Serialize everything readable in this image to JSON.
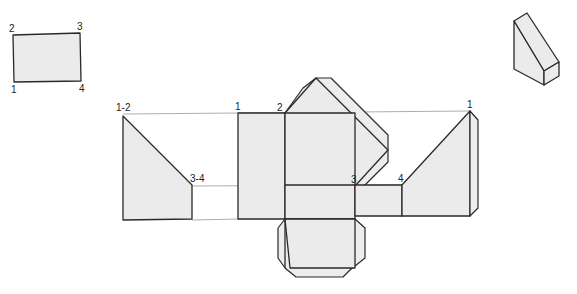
{
  "diagram": {
    "title": "",
    "colors": {
      "fill": "#ebebeb",
      "stroke": "#2a2a2a",
      "projection": "#8a8a8a"
    },
    "top_view": {
      "labels": {
        "p2": "2",
        "p3": "3",
        "p1": "1",
        "p4": "4"
      }
    },
    "pictorial_view": {
      "label": ""
    },
    "net": {
      "side_view_labels": {
        "p12": "1-2",
        "p34": "3-4"
      },
      "development_labels": {
        "p1_left": "1",
        "p2": "2",
        "p3": "3",
        "p4": "4",
        "p1_right": "1"
      }
    }
  }
}
